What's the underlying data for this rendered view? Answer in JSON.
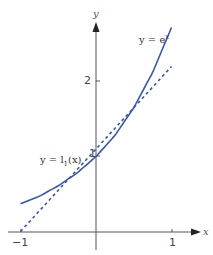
{
  "chart_data": {
    "type": "line",
    "title": "",
    "xlabel": "x",
    "ylabel": "y",
    "xlim": [
      -1,
      1
    ],
    "ylim": [
      0,
      2.7
    ],
    "grid": false,
    "legend": "inline labels",
    "x_ticks": [
      {
        "value": -1,
        "label": "−1"
      },
      {
        "value": 1,
        "label": "1"
      }
    ],
    "y_ticks": [
      {
        "value": 1,
        "label": "1"
      },
      {
        "value": 2,
        "label": "2"
      }
    ],
    "series": [
      {
        "name": "y = e^x",
        "style": "solid",
        "x": [
          -1,
          -0.75,
          -0.5,
          -0.25,
          0,
          0.25,
          0.5,
          0.75,
          1
        ],
        "values": [
          0.37,
          0.47,
          0.61,
          0.78,
          1.0,
          1.28,
          1.65,
          2.12,
          2.72
        ]
      },
      {
        "name": "y = l1(x)",
        "style": "dashed",
        "x": [
          -1,
          1
        ],
        "values": [
          0.0,
          2.2
        ]
      }
    ],
    "annotations": [
      {
        "text": "y = e^x",
        "near": "upper right of solid curve"
      },
      {
        "text": "y = l1(x)",
        "near": "dashed line, left of y-axis near y=1"
      }
    ],
    "colors": {
      "curve": "#3a55b4",
      "axes": "#555555"
    }
  },
  "labels": {
    "x_axis": "x",
    "y_axis": "y",
    "tick_x_neg1": "−1",
    "tick_x_1": "1",
    "tick_y_1": "1",
    "tick_y_2": "2",
    "exp_y": "y = e",
    "exp_sup": "x",
    "lin_y": "y = l",
    "lin_sub": "1",
    "lin_arg": "(x)"
  }
}
